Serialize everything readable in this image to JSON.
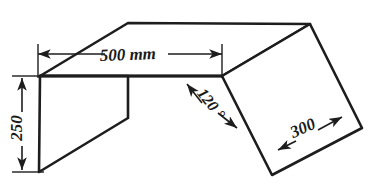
{
  "drawing": {
    "title": "Pictorial sketch of bent sheet metal part",
    "background_color": "#ffffff",
    "line_color": "#1d1d1d",
    "dimensions": [
      {
        "id": "width",
        "label": "500 mm",
        "value": 500,
        "unit": "mm",
        "orientation": "horizontal",
        "text_x": 128,
        "text_y": 60,
        "rotation": -2
      },
      {
        "id": "height",
        "label": "250",
        "value": 250,
        "unit": "mm",
        "orientation": "vertical",
        "text_x": 22,
        "text_y": 128,
        "rotation": -90
      },
      {
        "id": "flap-length",
        "label": "300",
        "value": 300,
        "unit": "mm",
        "orientation": "diagonal",
        "text_x": 305,
        "text_y": 133,
        "rotation": -24
      },
      {
        "id": "bend-angle",
        "label": "120 °",
        "value": 120,
        "unit": "degrees",
        "orientation": "diagonal",
        "text_x": 207,
        "text_y": 107,
        "rotation": 52
      }
    ],
    "geometry": {
      "top_face": "128,23 310,24 222,76 40,76",
      "left_face": "40,76 128,76 128,118 39,172",
      "left_outer_edge": "40,76 40,172",
      "left_bottom_edge": "39,172 128,118",
      "right_panel": "222,76 310,24 362,128 272,175",
      "center_junction_x": 222,
      "center_junction_y": 76
    }
  }
}
